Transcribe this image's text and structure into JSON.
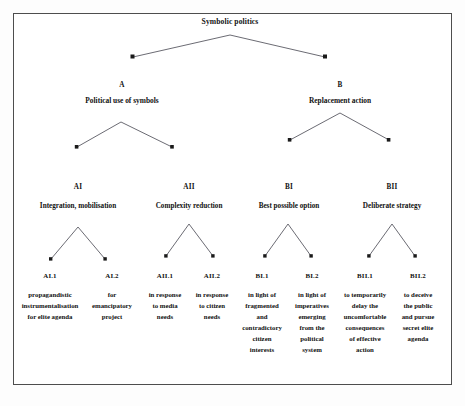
{
  "figure": {
    "root": {
      "label": "Symbolic politics"
    },
    "level1": [
      {
        "code": "A",
        "name": "Political use of symbols"
      },
      {
        "code": "B",
        "name": "Replacement action"
      }
    ],
    "level2": [
      {
        "code": "AI",
        "name": "Integration, mobilisation"
      },
      {
        "code": "AII",
        "name": "Complexity reduction"
      },
      {
        "code": "BI",
        "name": "Best possible option"
      },
      {
        "code": "BII",
        "name": "Deliberate strategy"
      }
    ],
    "leaves": [
      {
        "code": "AI.1",
        "lines": [
          "propagandistic",
          "instrumentalisation",
          "for elite agenda"
        ]
      },
      {
        "code": "AI.2",
        "lines": [
          "for",
          "emancipatory",
          "project"
        ]
      },
      {
        "code": "AII.1",
        "lines": [
          "in response",
          "to media",
          "needs"
        ]
      },
      {
        "code": "AII.2",
        "lines": [
          "in response",
          "to citizen",
          "needs"
        ]
      },
      {
        "code": "BI.1",
        "lines": [
          "in light of",
          "fragmented",
          "and",
          "contradictory",
          "citizen",
          "interests"
        ]
      },
      {
        "code": "BI.2",
        "lines": [
          "in light of",
          "imperatives",
          "emerging",
          "from the",
          "political",
          "system"
        ]
      },
      {
        "code": "BII.1",
        "lines": [
          "to temporarily",
          "delay the",
          "uncomfortable",
          "consequences",
          "of effective",
          "action"
        ]
      },
      {
        "code": "BII.2",
        "lines": [
          "to deceive",
          "the public",
          "and pursue",
          "secret elite",
          "agenda"
        ]
      }
    ],
    "colors": {
      "frame": "#4d4d4d",
      "connector": "#5a5a63",
      "arrowhead": "#1a1a1a",
      "text": "#111111",
      "background": "#ffffff"
    }
  }
}
